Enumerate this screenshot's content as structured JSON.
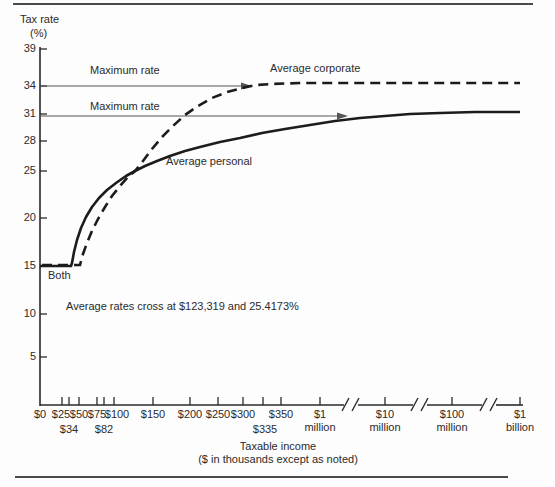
{
  "title": {
    "line1": "Tax rate",
    "line2": "(%)"
  },
  "x_axis_title": {
    "line1": "Taxable income",
    "line2": "($ in thousands except as noted)"
  },
  "annotations": {
    "max_rate_corporate": "Maximum rate",
    "max_rate_personal": "Maximum rate",
    "avg_corporate": "Average corporate",
    "avg_personal": "Average personal",
    "both": "Both",
    "cross_note": "Average rates cross at $123,319 and 25.4173%"
  },
  "colors": {
    "curve": "#1c1c1c",
    "thin_line": "#555555",
    "axis": "#2a2a2a",
    "text": "#2b2b2b",
    "rule": "#4a4a4a",
    "background": "#fdfdfd"
  },
  "chart_data": {
    "type": "line",
    "title": "",
    "ylabel": "Tax rate (%)",
    "xlabel": "Taxable income ($ in thousands except as noted)",
    "ylim": [
      0,
      39
    ],
    "y_ticks": [
      39,
      34,
      31,
      28,
      25,
      20,
      15,
      10,
      5
    ],
    "x_tick_labels": [
      "$0",
      "$25",
      "$34",
      "$50",
      "$75",
      "$82",
      "$100",
      "$150",
      "$200",
      "$250",
      "$300",
      "$335",
      "$350",
      "$1 million",
      "$10 million",
      "$100 million",
      "$1 billion"
    ],
    "x_axis_breaks": [
      "after $1 million",
      "after $10 million",
      "after $100 million"
    ],
    "crossing_point": {
      "x_dollars": 123319,
      "y_pct": 25.4173
    },
    "series": [
      {
        "name": "Average personal",
        "style": "solid",
        "asymptote_label": "Maximum rate",
        "asymptote_pct": 31,
        "x_thousands": [
          0,
          34,
          50,
          72,
          82,
          100,
          123.319,
          150,
          200,
          250,
          300,
          335,
          1000,
          1000000
        ],
        "y_pct": [
          15,
          15,
          15,
          15,
          21,
          23.5,
          25.4173,
          26.8,
          28.2,
          29.2,
          29.9,
          30.3,
          31,
          31
        ]
      },
      {
        "name": "Average corporate",
        "style": "dashed",
        "asymptote_label": "Maximum rate",
        "asymptote_pct": 34,
        "x_thousands": [
          0,
          34,
          50,
          82,
          100,
          123.319,
          150,
          200,
          250,
          300,
          335,
          1000,
          1000000
        ],
        "y_pct": [
          15,
          15,
          15,
          15,
          20.5,
          25.4173,
          29.5,
          32.7,
          33.8,
          34,
          34,
          34,
          34
        ]
      }
    ],
    "notes": [
      "Both curves coincide at 15% at low incomes (label: Both)"
    ]
  },
  "render": {
    "y_axis": {
      "x": 40,
      "y1": 47,
      "y2": 406
    },
    "x_axis_y": 405,
    "x_axis_segments": [
      [
        40,
        344
      ],
      [
        358,
        413
      ],
      [
        427,
        482
      ],
      [
        496,
        523
      ]
    ],
    "break_slash_pairs": [
      [
        345,
        355
      ],
      [
        414,
        424
      ],
      [
        483,
        493
      ]
    ],
    "x_tick_marks": [
      62,
      69,
      79,
      97,
      104,
      114,
      153,
      190,
      218,
      243,
      263,
      281,
      320,
      385,
      452,
      520
    ],
    "y_tick_marks": [
      49,
      86,
      114,
      141,
      171,
      218,
      266,
      314,
      357
    ],
    "y_tick_labels": [
      {
        "label": "39",
        "y": 49
      },
      {
        "label": "34",
        "y": 86
      },
      {
        "label": "31",
        "y": 114
      },
      {
        "label": "28",
        "y": 141
      },
      {
        "label": "25",
        "y": 171
      },
      {
        "label": "20",
        "y": 218
      },
      {
        "label": "15",
        "y": 266
      },
      {
        "label": "10",
        "y": 314
      },
      {
        "label": "5",
        "y": 357
      }
    ],
    "x_tick_labels_row1": [
      {
        "label": "$0",
        "x": 40
      },
      {
        "label": "$25",
        "x": 61
      },
      {
        "label": "$50",
        "x": 79
      },
      {
        "label": "$75",
        "x": 97
      },
      {
        "label": "$100",
        "x": 117
      },
      {
        "label": "$150",
        "x": 153
      },
      {
        "label": "$200",
        "x": 190
      },
      {
        "label": "$250",
        "x": 218
      },
      {
        "label": "$300",
        "x": 243
      },
      {
        "label": "$350",
        "x": 281
      }
    ],
    "x_tick_labels_row2": [
      {
        "label": "$34",
        "x": 69
      },
      {
        "label": "$82",
        "x": 104
      },
      {
        "label": "$335",
        "x": 265
      }
    ],
    "x_tick_labels_two_line": [
      {
        "line1": "$1",
        "line2": "million",
        "x": 320
      },
      {
        "line1": "$10",
        "line2": "million",
        "x": 385
      },
      {
        "line1": "$100",
        "line2": "million",
        "x": 452
      },
      {
        "line1": "$1",
        "line2": "billion",
        "x": 520
      }
    ],
    "thin_arrow_lines": [
      {
        "y": 86,
        "x1": 40,
        "x2": 252
      },
      {
        "y": 116,
        "x1": 40,
        "x2": 348
      }
    ],
    "solid_points": [
      [
        40,
        266
      ],
      [
        71,
        266
      ],
      [
        72,
        263
      ],
      [
        74,
        252
      ],
      [
        77,
        240
      ],
      [
        81,
        228
      ],
      [
        86,
        217
      ],
      [
        92,
        207
      ],
      [
        99,
        198
      ],
      [
        107,
        190
      ],
      [
        116,
        183
      ],
      [
        126,
        176
      ],
      [
        135,
        171
      ],
      [
        145,
        166
      ],
      [
        157,
        161
      ],
      [
        170,
        156
      ],
      [
        185,
        151
      ],
      [
        200,
        147
      ],
      [
        220,
        142
      ],
      [
        240,
        138
      ],
      [
        262,
        133
      ],
      [
        285,
        129
      ],
      [
        310,
        125
      ],
      [
        335,
        121
      ],
      [
        360,
        118
      ],
      [
        385,
        116
      ],
      [
        410,
        114
      ],
      [
        440,
        113
      ],
      [
        475,
        112
      ],
      [
        520,
        112
      ]
    ],
    "dashed_points": [
      [
        42,
        265
      ],
      [
        80,
        265
      ],
      [
        83,
        254
      ],
      [
        87,
        243
      ],
      [
        92,
        231
      ],
      [
        98,
        219
      ],
      [
        105,
        207
      ],
      [
        112,
        196
      ],
      [
        120,
        186
      ],
      [
        128,
        177
      ],
      [
        135,
        171
      ],
      [
        143,
        161
      ],
      [
        152,
        149
      ],
      [
        162,
        137
      ],
      [
        173,
        126
      ],
      [
        185,
        115
      ],
      [
        198,
        106
      ],
      [
        212,
        98
      ],
      [
        227,
        92
      ],
      [
        242,
        88
      ],
      [
        256,
        85
      ],
      [
        272,
        84
      ],
      [
        300,
        83
      ],
      [
        350,
        83
      ],
      [
        420,
        83
      ],
      [
        520,
        83
      ]
    ]
  }
}
